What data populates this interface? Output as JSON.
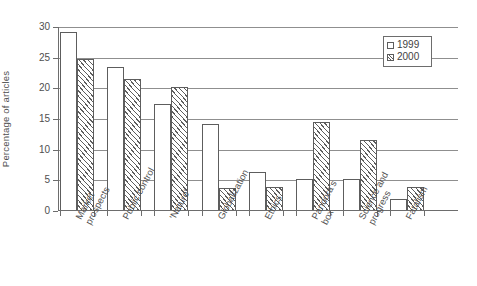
{
  "chart_data": {
    "type": "bar",
    "title": "",
    "subtitle": "",
    "xlabel": "",
    "ylabel": "Percentage of articles",
    "ylim": [
      0,
      30
    ],
    "yticks": [
      0,
      5,
      10,
      15,
      20,
      25,
      30
    ],
    "ytick_labels": [
      "0",
      "5",
      "10",
      "15",
      "20",
      "25",
      "30"
    ],
    "grid": true,
    "grid_axis": "y",
    "legend_position": "top-right",
    "categories": [
      "Market prospects",
      "Public control",
      "'Nature'",
      "Globalization",
      "Ethics",
      "Pandora's box",
      "Science and progress",
      "Fatalism"
    ],
    "category_lines": [
      [
        "Market",
        "prospects"
      ],
      [
        "Public control"
      ],
      [
        "'Nature'"
      ],
      [
        "Globalization"
      ],
      [
        "Ethics"
      ],
      [
        "Pandora's",
        "box"
      ],
      [
        "Science and",
        "progress"
      ],
      [
        "Fatalism"
      ]
    ],
    "series": [
      {
        "name": "1999",
        "style": "open",
        "values": [
          29.2,
          23.5,
          17.5,
          14.2,
          6.3,
          5.2,
          5.3,
          2.0
        ]
      },
      {
        "name": "2000",
        "style": "hatched",
        "values": [
          24.8,
          21.6,
          20.2,
          3.7,
          3.9,
          14.5,
          11.5,
          3.9
        ]
      }
    ],
    "annotations": []
  },
  "legend": {
    "entries": [
      {
        "label": "1999",
        "style": "open"
      },
      {
        "label": "2000",
        "style": "hatched"
      }
    ]
  },
  "colors": {
    "axis": "#6d6d6d",
    "grid": "#8f8f8f",
    "bar_outline": "#5d5d5d",
    "bar_fill": "#ffffff",
    "text": "#4f4f4f",
    "background": "#ffffff"
  }
}
